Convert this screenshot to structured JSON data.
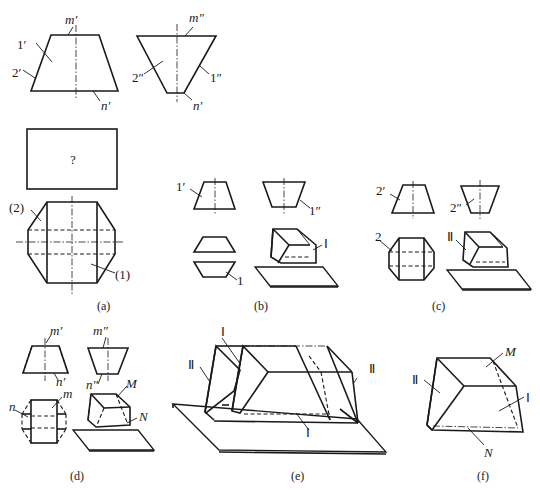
{
  "figure": {
    "panels": [
      {
        "id": "a",
        "caption": "(a)",
        "labels": {
          "m_front": "m′",
          "one_front": "1′",
          "two_front": "2′",
          "n_front": "n′",
          "m_side": "m″",
          "two_side": "2″",
          "one_side": "1″",
          "n_side": "n′",
          "unknown": "?",
          "two_top": "(2)",
          "one_top": "(1)"
        }
      },
      {
        "id": "b",
        "caption": "(b)",
        "labels": {
          "one_front": "1′",
          "one_side": "1″",
          "one_top": "1",
          "roman": "Ⅰ"
        }
      },
      {
        "id": "c",
        "caption": "(c)",
        "labels": {
          "two_front": "2′",
          "two_side": "2″",
          "two_top": "2",
          "roman": "Ⅱ"
        }
      },
      {
        "id": "d",
        "caption": "(d)",
        "labels": {
          "m_front": "m′",
          "n_front": "n′",
          "m_side": "m″",
          "n_side": "n″",
          "n_top": "n",
          "m_top": "m",
          "M": "M",
          "N": "N"
        }
      },
      {
        "id": "e",
        "caption": "(e)",
        "labels": {
          "roman1_top": "Ⅰ",
          "roman2_left": "Ⅱ",
          "roman2_right": "Ⅱ",
          "roman1_bottom": "Ⅰ"
        }
      },
      {
        "id": "f",
        "caption": "(f)",
        "labels": {
          "roman2": "Ⅱ",
          "M": "M",
          "roman1": "Ⅰ",
          "N": "N"
        }
      }
    ]
  }
}
